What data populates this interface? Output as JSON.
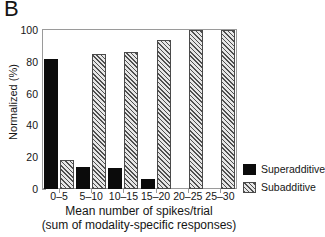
{
  "panel": {
    "letter": "B"
  },
  "chart_data": {
    "type": "bar",
    "title": "",
    "xlabel": "Mean number of spikes/trial",
    "xlabel_line2": "(sum of modality-specific responses)",
    "ylabel": "Normalized (%)",
    "ylim": [
      0,
      100
    ],
    "yticks": [
      0,
      20,
      40,
      60,
      80,
      100
    ],
    "ytick_labels": [
      "0",
      "20",
      "40",
      "60",
      "80",
      "100"
    ],
    "categories": [
      "0–5",
      "5–10",
      "10–15",
      "15–20",
      "20–25",
      "25–30"
    ],
    "grid": false,
    "legend_position": "right",
    "series": [
      {
        "name": "Superadditive",
        "fill": "solid",
        "color": "#0b0b0b",
        "values": [
          82,
          14,
          13,
          6,
          0,
          0
        ]
      },
      {
        "name": "Subadditive",
        "fill": "hatch",
        "color": "#d7d7d7",
        "values": [
          18,
          85,
          86,
          94,
          100,
          100
        ]
      }
    ]
  },
  "legend": {
    "items": [
      {
        "label": "Superadditive",
        "fill": "solid"
      },
      {
        "label": "Subadditive",
        "fill": "hatch"
      }
    ]
  }
}
